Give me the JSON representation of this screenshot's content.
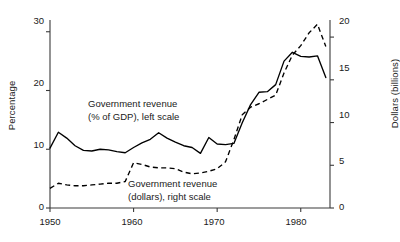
{
  "chart_data": {
    "type": "line",
    "title": "",
    "xlabel": "",
    "ylabel": "Percentage",
    "y2label": "Dollars (billions)",
    "xlim": [
      1950,
      1983.5
    ],
    "ylim": [
      0,
      32
    ],
    "y2lim": [
      0,
      22
    ],
    "grid": false,
    "legend_position": "inline-annotations",
    "xticks": [
      1950,
      1960,
      1970,
      1980
    ],
    "xtick_labels": [
      "1950",
      "1960",
      "1970",
      "1980"
    ],
    "yticks": [
      0,
      10,
      20,
      30
    ],
    "ytick_labels": [
      "0",
      "10",
      "20",
      "30"
    ],
    "y2ticks": [
      0,
      5,
      10,
      15,
      20
    ],
    "y2tick_labels": [
      "0",
      "5",
      "10",
      "15",
      "20"
    ],
    "x": [
      1950,
      1951,
      1952,
      1953,
      1954,
      1955,
      1956,
      1957,
      1958,
      1959,
      1960,
      1961,
      1962,
      1963,
      1964,
      1965,
      1966,
      1967,
      1968,
      1969,
      1970,
      1971,
      1972,
      1973,
      1974,
      1975,
      1976,
      1977,
      1978,
      1979,
      1980,
      1981,
      1982,
      1983
    ],
    "series": [
      {
        "name": "Government revenue (% of GDP), left scale",
        "axis": "left",
        "style": "solid",
        "color": "#000000",
        "values": [
          10.2,
          12.9,
          11.9,
          10.6,
          9.8,
          9.7,
          10.0,
          9.9,
          9.6,
          9.4,
          10.3,
          11.1,
          11.7,
          12.8,
          11.9,
          11.2,
          10.6,
          10.3,
          9.3,
          12.0,
          10.9,
          10.8,
          11.0,
          14.5,
          17.6,
          19.7,
          19.8,
          21.0,
          25.0,
          26.5,
          25.8,
          25.7,
          25.9,
          22.2
        ],
        "values_note": "solid line read against left percentage axis"
      },
      {
        "name": "Government revenue (dollars), right scale",
        "axis": "right",
        "style": "dashed",
        "color": "#000000",
        "values": [
          2.3,
          2.9,
          2.7,
          2.6,
          2.6,
          2.7,
          2.8,
          2.9,
          2.9,
          3.1,
          5.3,
          5.1,
          4.8,
          4.7,
          4.7,
          4.6,
          4.2,
          4.0,
          4.1,
          4.3,
          4.6,
          5.4,
          8.0,
          10.9,
          11.8,
          12.2,
          12.7,
          13.2,
          15.8,
          17.9,
          19.0,
          20.5,
          21.5,
          18.9
        ],
        "values_note": "dashed line read against right dollars axis"
      }
    ],
    "annotations": [
      {
        "id": "annotation-solid",
        "line1": "Government revenue",
        "line2": "(% of GDP), left scale"
      },
      {
        "id": "annotation-dashed",
        "line1": "Government revenue",
        "line2": "(dollars), right scale"
      }
    ]
  },
  "axes": {
    "left_title": "Percentage",
    "right_title": "Dollars (billions)"
  },
  "ticks": {
    "left": [
      "30",
      "20",
      "10",
      "0"
    ],
    "right": [
      "20",
      "15",
      "10",
      "5",
      "0"
    ],
    "bottom": [
      "1950",
      "1960",
      "1970",
      "1980"
    ]
  },
  "annotations": {
    "solid_line1": "Government revenue",
    "solid_line2": "(% of GDP), left scale",
    "dashed_line1": "Government revenue",
    "dashed_line2": "(dollars), right scale"
  },
  "colors": {
    "ink": "#000000",
    "background": "#ffffff",
    "axis": "#3a3a3a"
  }
}
